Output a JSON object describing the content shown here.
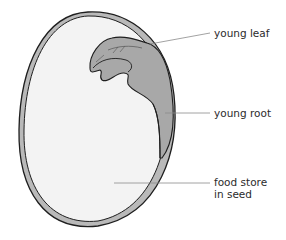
{
  "diagram": {
    "labels": {
      "young_leaf": "young leaf",
      "young_root": "young root",
      "food_store_line1": "food store",
      "food_store_line2": "in seed"
    },
    "colors": {
      "outline": "#1e1e1e",
      "seed_coat": "#b9b9b9",
      "food_store": "#f3f3f3",
      "embryo": "#a8a8a8",
      "leader_line": "#8a8a8a",
      "text": "#2b2b2b"
    }
  }
}
